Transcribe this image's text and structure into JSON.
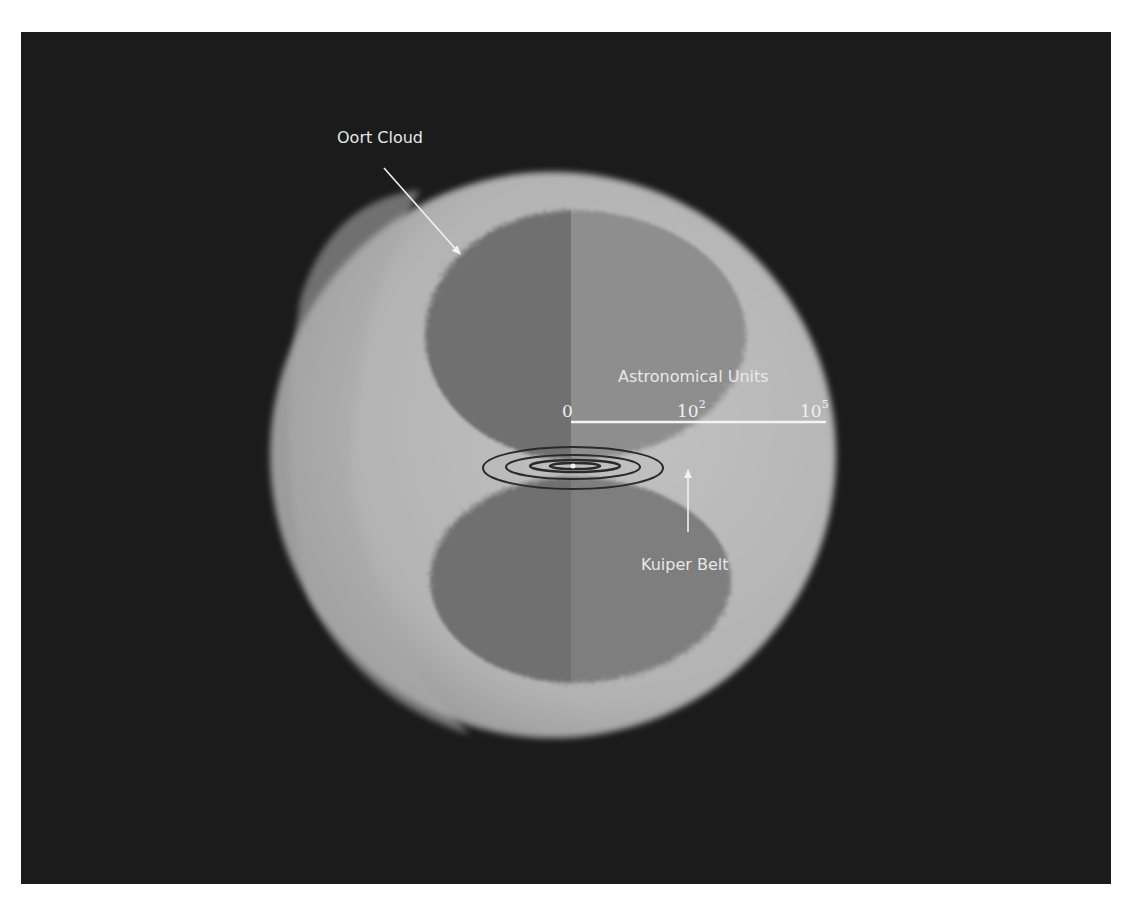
{
  "diagram": {
    "labels": {
      "oort_cloud": "Oort Cloud",
      "kuiper_belt": "Kuiper Belt",
      "axis_title": "Astronomical Units"
    },
    "scale": {
      "ticks": [
        {
          "base": "0",
          "exp": ""
        },
        {
          "base": "10",
          "exp": "2"
        },
        {
          "base": "10",
          "exp": "5"
        }
      ]
    },
    "colors": {
      "background": "#1b1b1b",
      "outer_shell": "#b6b6b6",
      "inner_dark": "#6f6f6f",
      "inner_wedge": "#8e8e8e",
      "label_text": "#e8e8e8",
      "orbit_lines": "#2a2a2a"
    }
  }
}
